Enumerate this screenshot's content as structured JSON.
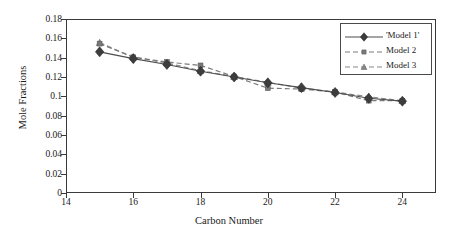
{
  "chart_data": {
    "type": "line",
    "title": "",
    "xlabel": "Carbon Number",
    "ylabel": "Mole Fractions",
    "xlim": [
      14,
      25
    ],
    "ylim": [
      0,
      0.18
    ],
    "grid": false,
    "legend_position": "top-right",
    "x_ticks": [
      14,
      16,
      18,
      20,
      22,
      24
    ],
    "x_tick_labels": [
      "14",
      "16",
      "18",
      "20",
      "22",
      "24"
    ],
    "y_ticks": [
      0,
      0.02,
      0.04,
      0.06,
      0.08,
      0.1,
      0.12,
      0.14,
      0.16,
      0.18
    ],
    "y_tick_labels": [
      "0",
      "0.02",
      "0.04",
      "0.06",
      "0.08",
      "0.1",
      "0.12",
      "0.14",
      "0.16",
      "0.18"
    ],
    "x": [
      15,
      16,
      17,
      18,
      19,
      20,
      21,
      22,
      23,
      24
    ],
    "series": [
      {
        "name": "'Model 1'",
        "marker": "diamond",
        "line_style": "solid",
        "color": "#4d4d4d",
        "values": [
          0.146,
          0.139,
          0.133,
          0.126,
          0.12,
          0.114,
          0.109,
          0.104,
          0.098,
          0.095
        ]
      },
      {
        "name": "Model 2",
        "marker": "square",
        "line_style": "dashed",
        "color": "#7a7a7a",
        "values": [
          0.1545,
          0.1405,
          0.1355,
          0.132,
          0.1205,
          0.1085,
          0.1075,
          0.1045,
          0.0955,
          0.0955
        ]
      },
      {
        "name": "Model 3",
        "marker": "triangle",
        "line_style": "dashed",
        "color": "#888888",
        "values": [
          0.1555,
          0.1405,
          0.1345,
          0.1265,
          0.1205,
          0.1145,
          0.1085,
          0.1045,
          0.0995,
          0.0955
        ]
      }
    ]
  }
}
